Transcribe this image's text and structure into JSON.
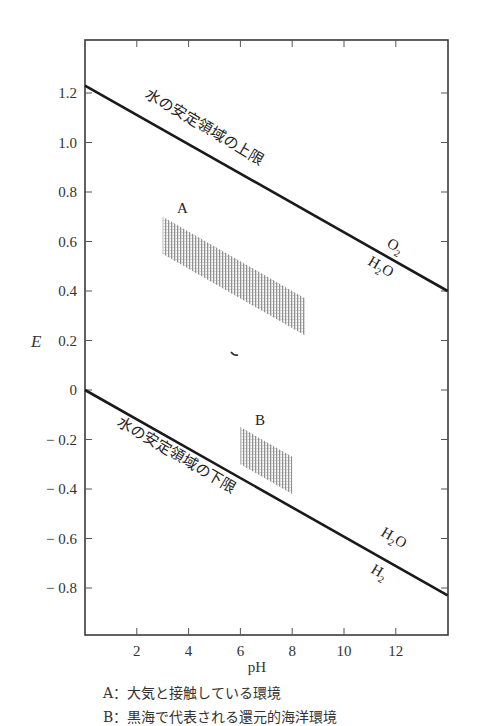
{
  "chart_data": {
    "type": "line",
    "title": "",
    "xlabel": "pH",
    "ylabel": "E",
    "xlim": [
      0,
      14
    ],
    "ylim": [
      -1.0,
      1.4
    ],
    "x_ticks": [
      2,
      4,
      6,
      8,
      10,
      12
    ],
    "x_tick_labels": [
      "2",
      "4",
      "6",
      "8",
      "10",
      "12"
    ],
    "y_ticks": [
      1.2,
      1.0,
      0.8,
      0.6,
      0.4,
      0.2,
      0,
      -0.2,
      -0.4,
      -0.6,
      -0.8
    ],
    "y_tick_labels": [
      "1.2",
      "1.0",
      "0.8",
      "0.6",
      "0.4",
      "0.2",
      "0",
      "− 0.2",
      "− 0.4",
      "− 0.6",
      "− 0.8"
    ],
    "grid": false,
    "series": [
      {
        "name": "水の安定領域の上限",
        "x": [
          0,
          14
        ],
        "y": [
          1.23,
          0.4
        ],
        "species_above": "O2",
        "species_below": "H2O"
      },
      {
        "name": "水の安定領域の下限",
        "x": [
          0,
          14
        ],
        "y": [
          0.0,
          -0.83
        ],
        "species_above": "H2O",
        "species_below": "H2"
      }
    ],
    "regions": [
      {
        "name": "A",
        "description": "大気と接触している環境",
        "polygon": [
          [
            3.0,
            0.7
          ],
          [
            8.5,
            0.37
          ],
          [
            8.5,
            0.22
          ],
          [
            3.0,
            0.55
          ]
        ],
        "fill": "hatched"
      },
      {
        "name": "B",
        "description": "黒海で代表される還元的海洋環境",
        "polygon": [
          [
            6.0,
            -0.15
          ],
          [
            8.0,
            -0.27
          ],
          [
            8.0,
            -0.42
          ],
          [
            6.0,
            -0.3
          ]
        ],
        "fill": "hatched"
      }
    ],
    "annotations": [
      {
        "text": "水の安定領域の上限",
        "along": "upper line"
      },
      {
        "text": "水の安定領域の下限",
        "along": "lower line"
      },
      {
        "text": "O2",
        "near": [
          12.5,
          0.5
        ]
      },
      {
        "text": "H2O",
        "near": [
          12.0,
          0.4
        ]
      },
      {
        "text": "H2O",
        "near": [
          12.0,
          -0.58
        ]
      },
      {
        "text": "H2",
        "near": [
          11.6,
          -0.7
        ]
      },
      {
        "text": "A",
        "near": [
          3.4,
          0.74
        ]
      },
      {
        "text": "B",
        "near": [
          6.6,
          -0.08
        ]
      }
    ]
  },
  "labels": {
    "upper_line": "水の安定領域の上限",
    "lower_line": "水の安定領域の下限",
    "upper_species_top": "O",
    "upper_species_top_sub": "2",
    "upper_species_bottom": "H",
    "upper_species_bottom_sub": "2",
    "upper_species_bottom_tail": "O",
    "lower_species_top": "H",
    "lower_species_top_sub": "2",
    "lower_species_top_tail": "O",
    "lower_species_bottom": "H",
    "lower_species_bottom_sub": "2",
    "region_a": "A",
    "region_b": "B",
    "x_axis": "pH",
    "y_axis": "E"
  },
  "captions": [
    "A：大気と接触している環境",
    "B：黒海で代表される還元的海洋環境"
  ]
}
